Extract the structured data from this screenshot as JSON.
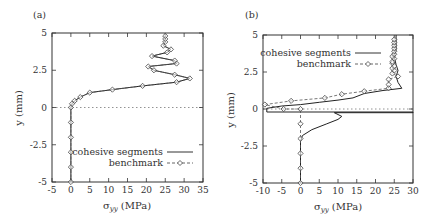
{
  "chart_data": [
    {
      "type": "line",
      "panel_label": "(a)",
      "title": "",
      "xlabel": "σyy (MPa)",
      "ylabel": "y (mm)",
      "xlim": [
        -5,
        35
      ],
      "ylim": [
        -5,
        5
      ],
      "xticks": [
        -5,
        0,
        5,
        10,
        15,
        20,
        25,
        30,
        35
      ],
      "yticks": [
        -5,
        -2.5,
        0,
        2.5,
        5
      ],
      "ytick_labels": [
        "-5",
        "-2.5",
        "0",
        "2.5",
        "5"
      ],
      "grid": false,
      "reference_line": {
        "y": 0,
        "style": "dotted"
      },
      "legend": {
        "position": "lower right",
        "entries": [
          "cohesive segments",
          "benchmark"
        ]
      },
      "series": [
        {
          "name": "cohesive segments",
          "style": "solid",
          "points": [
            [
              0,
              -5
            ],
            [
              0,
              -4
            ],
            [
              0,
              -3
            ],
            [
              0,
              -2
            ],
            [
              0,
              -1
            ],
            [
              0,
              0
            ],
            [
              0.3,
              0.25
            ],
            [
              1,
              0.45
            ],
            [
              2.5,
              0.7
            ],
            [
              5,
              1.0
            ],
            [
              11,
              1.2
            ],
            [
              19,
              1.45
            ],
            [
              28,
              1.7
            ],
            [
              31.5,
              1.95
            ],
            [
              27.5,
              2.2
            ],
            [
              22,
              2.5
            ],
            [
              20.5,
              2.75
            ],
            [
              28,
              2.95
            ],
            [
              27.5,
              3.15
            ],
            [
              21.5,
              3.45
            ],
            [
              25.5,
              3.7
            ],
            [
              26.5,
              3.9
            ],
            [
              24.5,
              4.15
            ],
            [
              25,
              4.4
            ],
            [
              25,
              4.6
            ],
            [
              25,
              4.8
            ]
          ]
        },
        {
          "name": "benchmark",
          "style": "dash-dot with diamond markers",
          "points": [
            [
              0,
              -5
            ],
            [
              0,
              -4
            ],
            [
              0,
              -3
            ],
            [
              0,
              -2
            ],
            [
              0,
              -1
            ],
            [
              0,
              0
            ],
            [
              0.3,
              0.25
            ],
            [
              1,
              0.45
            ],
            [
              2.5,
              0.7
            ],
            [
              5,
              1.0
            ],
            [
              11,
              1.2
            ],
            [
              19,
              1.45
            ],
            [
              28,
              1.7
            ],
            [
              31.5,
              1.95
            ],
            [
              27.5,
              2.2
            ],
            [
              22,
              2.5
            ],
            [
              20.5,
              2.75
            ],
            [
              28,
              2.95
            ],
            [
              27.5,
              3.15
            ],
            [
              21.5,
              3.45
            ],
            [
              25.5,
              3.7
            ],
            [
              26.5,
              3.9
            ],
            [
              24.5,
              4.15
            ],
            [
              25,
              4.4
            ],
            [
              25,
              4.6
            ],
            [
              25,
              4.8
            ]
          ]
        }
      ]
    },
    {
      "type": "line",
      "panel_label": "(b)",
      "title": "",
      "xlabel": "σyy (MPa)",
      "ylabel": "y (mm)",
      "xlim": [
        -10,
        30
      ],
      "ylim": [
        -5,
        5
      ],
      "xticks": [
        -10,
        -5,
        0,
        5,
        10,
        15,
        20,
        25,
        30
      ],
      "yticks": [
        -5,
        -2.5,
        0,
        2.5,
        5
      ],
      "ytick_labels": [
        "-5",
        "-2.5",
        "0",
        "2.5",
        "5"
      ],
      "grid": false,
      "reference_line": {
        "y": 0,
        "style": "dotted"
      },
      "legend": {
        "position": "upper left",
        "entries": [
          "cohesive segments",
          "benchmark"
        ]
      },
      "series": [
        {
          "name": "cohesive segments",
          "style": "solid",
          "points": [
            [
              0,
              -5
            ],
            [
              0,
              -4
            ],
            [
              0,
              -3
            ],
            [
              0,
              -2.2
            ],
            [
              0.5,
              -1.8
            ],
            [
              3,
              -1.4
            ],
            [
              7,
              -1.0
            ],
            [
              10,
              -0.7
            ],
            [
              11,
              -0.5
            ],
            [
              9,
              -0.25
            ],
            [
              30,
              -0.25
            ],
            [
              30,
              -0.2
            ],
            [
              -9,
              -0.2
            ],
            [
              -9,
              0.05
            ],
            [
              -5,
              0.2
            ],
            [
              0,
              0.3
            ],
            [
              5,
              0.45
            ],
            [
              10,
              0.6
            ],
            [
              14,
              0.75
            ],
            [
              17,
              1.05
            ],
            [
              22,
              1.25
            ],
            [
              27,
              1.4
            ],
            [
              26,
              1.8
            ],
            [
              25.5,
              2.2
            ],
            [
              26,
              2.6
            ],
            [
              25.5,
              3.0
            ],
            [
              25,
              3.5
            ],
            [
              25.5,
              4.0
            ],
            [
              25.5,
              4.5
            ],
            [
              25.5,
              5.0
            ]
          ]
        },
        {
          "name": "benchmark",
          "style": "dashed with diamond markers",
          "points": [
            [
              0,
              -5
            ],
            [
              0,
              -4
            ],
            [
              0,
              -3
            ],
            [
              0,
              -2
            ],
            [
              0,
              -1
            ],
            [
              0,
              0
            ],
            [
              -4.5,
              0
            ],
            [
              -9.5,
              0.3
            ],
            [
              -2.5,
              0.55
            ],
            [
              6.5,
              0.75
            ],
            [
              11,
              1.0
            ],
            [
              17,
              1.2
            ],
            [
              23.5,
              1.4
            ],
            [
              23.5,
              1.65
            ],
            [
              23.5,
              2.0
            ],
            [
              26,
              2.2
            ],
            [
              24.5,
              2.4
            ],
            [
              25,
              2.6
            ],
            [
              24.5,
              2.75
            ],
            [
              25,
              2.9
            ],
            [
              24.5,
              3.1
            ],
            [
              24.5,
              3.2
            ],
            [
              25,
              3.4
            ],
            [
              24.5,
              3.55
            ],
            [
              25,
              3.7
            ],
            [
              25,
              3.9
            ],
            [
              25,
              4.1
            ],
            [
              25,
              4.3
            ],
            [
              25,
              4.5
            ],
            [
              25,
              4.7
            ]
          ]
        }
      ]
    }
  ],
  "panels": {
    "a": {
      "label": "(a)",
      "ylabel": "y (mm)",
      "xlabel_main": "σ",
      "xlabel_sub": "yy",
      "xlabel_rest": " (MPa)",
      "legend": [
        "cohesive segments",
        "benchmark"
      ]
    },
    "b": {
      "label": "(b)",
      "ylabel": "y (mm)",
      "xlabel_main": "σ",
      "xlabel_sub": "yy",
      "xlabel_rest": " (MPa)",
      "legend": [
        "cohesive segments",
        "benchmark"
      ]
    }
  },
  "colors": {
    "line": "#333333",
    "frame": "#333333",
    "reference": "#777777"
  }
}
